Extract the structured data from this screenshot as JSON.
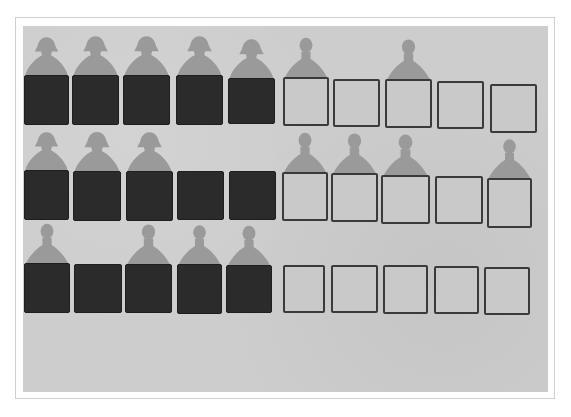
{
  "image": {
    "description": "Photograph of paper cut-out figures standing behind rows of dark and light squares",
    "colors": {
      "background": "#cdcdcd",
      "dark_square": "#2b2b2b",
      "light_square_fill": "#c9c9c9",
      "light_square_border": "#3a3a3a",
      "figure": "#9a9a9a"
    },
    "rows": [
      {
        "index": 1,
        "squares": [
          {
            "type": "dark",
            "x": 1,
            "y": 49,
            "w": 45,
            "h": 50,
            "figure": "girl"
          },
          {
            "type": "dark",
            "x": 49,
            "y": 49,
            "w": 47,
            "h": 50,
            "figure": "girl"
          },
          {
            "type": "dark",
            "x": 100,
            "y": 49,
            "w": 47,
            "h": 50,
            "figure": "girl"
          },
          {
            "type": "dark",
            "x": 153,
            "y": 49,
            "w": 47,
            "h": 50,
            "figure": "girl"
          },
          {
            "type": "dark",
            "x": 205,
            "y": 52,
            "w": 47,
            "h": 46,
            "figure": "girl"
          },
          {
            "type": "light",
            "x": 260,
            "y": 51,
            "w": 46,
            "h": 49,
            "figure": "boy"
          },
          {
            "type": "light",
            "x": 310,
            "y": 53,
            "w": 47,
            "h": 48,
            "figure": null
          },
          {
            "type": "light",
            "x": 362,
            "y": 53,
            "w": 47,
            "h": 49,
            "figure": "boy"
          },
          {
            "type": "light",
            "x": 414,
            "y": 55,
            "w": 47,
            "h": 48,
            "figure": null
          },
          {
            "type": "light",
            "x": 467,
            "y": 58,
            "w": 47,
            "h": 49,
            "figure": null
          }
        ]
      },
      {
        "index": 2,
        "squares": [
          {
            "type": "dark",
            "x": 1,
            "y": 144,
            "w": 45,
            "h": 50,
            "figure": "girl"
          },
          {
            "type": "dark",
            "x": 50,
            "y": 145,
            "w": 48,
            "h": 50,
            "figure": "girl"
          },
          {
            "type": "dark",
            "x": 103,
            "y": 145,
            "w": 47,
            "h": 50,
            "figure": "girl"
          },
          {
            "type": "dark",
            "x": 154,
            "y": 145,
            "w": 47,
            "h": 49,
            "figure": null
          },
          {
            "type": "dark",
            "x": 206,
            "y": 145,
            "w": 47,
            "h": 49,
            "figure": null
          },
          {
            "type": "light",
            "x": 259,
            "y": 146,
            "w": 46,
            "h": 49,
            "figure": "boy"
          },
          {
            "type": "light",
            "x": 308,
            "y": 147,
            "w": 47,
            "h": 49,
            "figure": "boy"
          },
          {
            "type": "light",
            "x": 358,
            "y": 149,
            "w": 49,
            "h": 49,
            "figure": "boy"
          },
          {
            "type": "light",
            "x": 412,
            "y": 150,
            "w": 48,
            "h": 48,
            "figure": null
          },
          {
            "type": "light",
            "x": 464,
            "y": 152,
            "w": 45,
            "h": 50,
            "figure": "boy"
          }
        ]
      },
      {
        "index": 3,
        "squares": [
          {
            "type": "dark",
            "x": 1,
            "y": 237,
            "w": 46,
            "h": 50,
            "figure": "boy"
          },
          {
            "type": "dark",
            "x": 51,
            "y": 238,
            "w": 48,
            "h": 49,
            "figure": null
          },
          {
            "type": "dark",
            "x": 102,
            "y": 238,
            "w": 47,
            "h": 49,
            "figure": "boy"
          },
          {
            "type": "dark",
            "x": 154,
            "y": 238,
            "w": 45,
            "h": 50,
            "figure": "boy"
          },
          {
            "type": "dark",
            "x": 203,
            "y": 239,
            "w": 46,
            "h": 48,
            "figure": "boy"
          },
          {
            "type": "light",
            "x": 260,
            "y": 239,
            "w": 42,
            "h": 48,
            "figure": null
          },
          {
            "type": "light",
            "x": 308,
            "y": 239,
            "w": 47,
            "h": 48,
            "figure": null
          },
          {
            "type": "light",
            "x": 360,
            "y": 239,
            "w": 45,
            "h": 49,
            "figure": null
          },
          {
            "type": "light",
            "x": 411,
            "y": 240,
            "w": 45,
            "h": 48,
            "figure": null
          },
          {
            "type": "light",
            "x": 461,
            "y": 241,
            "w": 46,
            "h": 48,
            "figure": null
          }
        ]
      }
    ]
  }
}
